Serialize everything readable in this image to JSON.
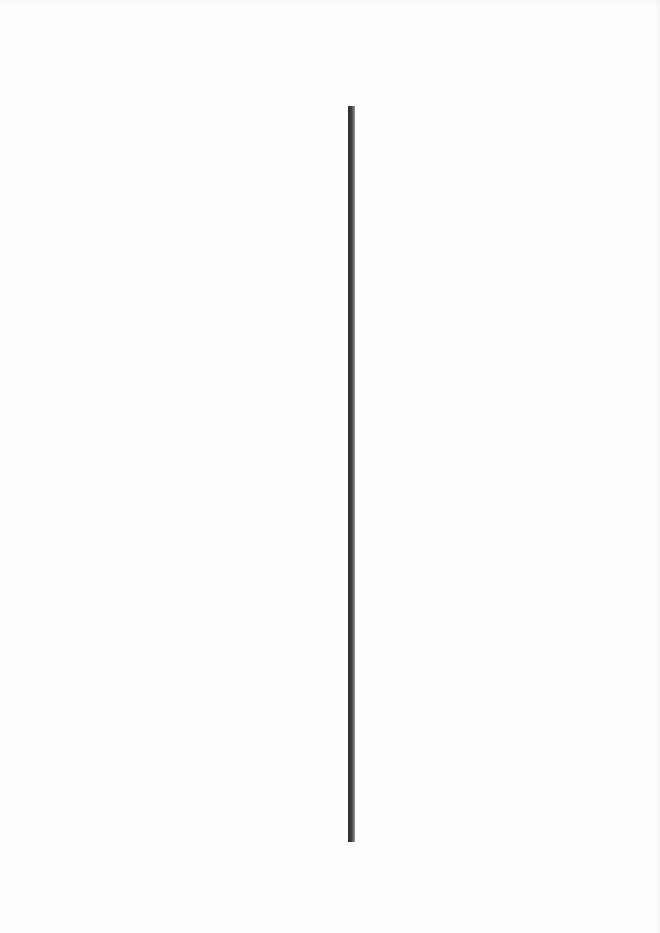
{
  "page": {
    "background_color": "#fefefe",
    "content": "blank scanned page"
  },
  "vertical_rule": {
    "color_dark": "#2e2e2e",
    "color_light": "#9a9a9a",
    "x": 348,
    "top": 106,
    "bottom": 842,
    "width": 7
  }
}
